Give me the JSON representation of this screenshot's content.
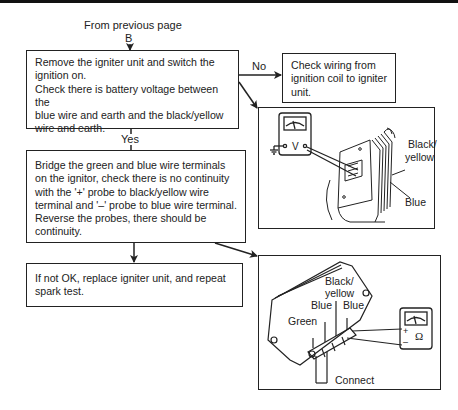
{
  "header": {
    "from_label": "From previous page",
    "connector": "B"
  },
  "flow": {
    "step1": {
      "text": "Remove the igniter unit and switch the ignition on. Check there is battery voltage between the blue wire and earth and the black/yellow wire and earth.",
      "lines": [
        "Remove the igniter unit and switch the",
        "ignition on.",
        "Check there is battery voltage between the",
        "blue wire and earth and the black/yellow",
        "wire and earth."
      ]
    },
    "no_branch": {
      "label": "No",
      "lines": [
        "Check wiring from",
        "ignition coil to igniter",
        "unit."
      ]
    },
    "yes_label": "Yes",
    "step2": {
      "lines": [
        "Bridge the green and blue wire terminals",
        "on the ignitor, check there is no continuity",
        "with the '+' probe to black/yellow wire",
        "terminal and '–' probe to blue wire terminal.",
        "Reverse the probes, there should be",
        "continuity."
      ]
    },
    "step3": {
      "lines": [
        "If not OK, replace igniter unit, and repeat",
        "spark test."
      ]
    }
  },
  "figures": {
    "voltage_test": {
      "meter_symbol": "V",
      "labels": {
        "black_yellow_1": "Black/",
        "black_yellow_2": "yellow",
        "blue": "Blue"
      }
    },
    "continuity_test": {
      "meter_symbol": "Ω",
      "plus": "+",
      "minus": "–",
      "labels": {
        "black_yellow_1": "Black/",
        "black_yellow_2": "yellow",
        "blue_left": "Blue",
        "blue_right": "Blue",
        "green": "Green",
        "connect": "Connect"
      }
    }
  }
}
